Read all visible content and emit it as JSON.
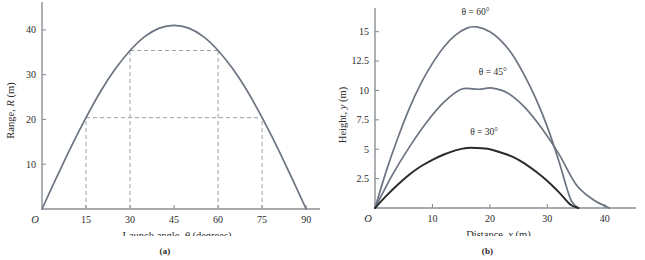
{
  "figure": {
    "panels": [
      {
        "key": "a",
        "caption": "(a)",
        "origin_label": "O"
      },
      {
        "key": "b",
        "caption": "(b)",
        "origin_label": "O"
      }
    ]
  },
  "chart_data": [
    {
      "type": "line",
      "panel": "a",
      "title": "",
      "xlabel": "Launch angle, θ (degrees)",
      "ylabel": "Range, R (m)",
      "xlabel_parts": {
        "pre": "Launch angle, ",
        "sym": "θ",
        "post": " (degrees)"
      },
      "ylabel_parts": {
        "pre": "Range, ",
        "sym": "R",
        "post": " (m)"
      },
      "xlim": [
        0,
        92
      ],
      "ylim": [
        0,
        44
      ],
      "xticks": [
        0,
        15,
        30,
        45,
        60,
        75,
        90
      ],
      "xticklabels": [
        "O",
        "15",
        "30",
        "45",
        "60",
        "75",
        "90"
      ],
      "yticks": [
        10,
        20,
        30,
        40
      ],
      "yticklabels": [
        "10",
        "20",
        "30",
        "40"
      ],
      "grid": false,
      "legend": "none",
      "series": [
        {
          "name": "Range vs launch angle",
          "color": "#6b7480",
          "x": [
            0,
            5,
            10,
            15,
            20,
            25,
            30,
            35,
            40,
            45,
            50,
            55,
            60,
            65,
            70,
            75,
            80,
            85,
            90
          ],
          "y": [
            0,
            7.1,
            14.0,
            20.4,
            26.3,
            31.3,
            35.4,
            38.5,
            40.4,
            41.0,
            40.4,
            38.5,
            35.4,
            31.3,
            26.3,
            20.4,
            14.0,
            7.1,
            0
          ]
        }
      ],
      "annotations": [
        {
          "type": "dashed-hline",
          "y": 35.4,
          "x_from": 30,
          "x_to": 60,
          "label": "equal range for 30° and 60°"
        },
        {
          "type": "dashed-hline",
          "y": 20.4,
          "x_from": 15,
          "x_to": 75,
          "label": "equal range for 15° and 75°"
        },
        {
          "type": "dashed-vline",
          "x": 15,
          "y_from": 0,
          "y_to": 20.4
        },
        {
          "type": "dashed-vline",
          "x": 30,
          "y_from": 0,
          "y_to": 35.4
        },
        {
          "type": "dashed-vline",
          "x": 60,
          "y_from": 0,
          "y_to": 35.4
        },
        {
          "type": "dashed-vline",
          "x": 75,
          "y_from": 0,
          "y_to": 20.4
        }
      ]
    },
    {
      "type": "line",
      "panel": "b",
      "title": "",
      "xlabel": "Distance, x (m)",
      "ylabel": "Height, y (m)",
      "xlabel_parts": {
        "pre": "Distance, ",
        "sym": "x",
        "post": " (m)"
      },
      "ylabel_parts": {
        "pre": "Height, ",
        "sym": "y",
        "post": " (m)"
      },
      "xlim": [
        0,
        43
      ],
      "ylim": [
        0,
        16.5
      ],
      "xticks": [
        0,
        10,
        20,
        30,
        40
      ],
      "xticklabels": [
        "O",
        "10",
        "20",
        "30",
        "40"
      ],
      "yticks": [
        2.5,
        5,
        7.5,
        10,
        12.5,
        15
      ],
      "yticklabels": [
        "2.5",
        "5",
        "7.5",
        "10",
        "12.5",
        "15"
      ],
      "grid": false,
      "legend": "inline-labels",
      "series": [
        {
          "name": "θ = 60°",
          "label": "θ = 60°",
          "color": "#6b7480",
          "label_x": 17.5,
          "label_y": 16.4,
          "x": [
            0,
            2,
            4,
            6,
            8,
            10,
            12,
            14,
            16,
            17.7,
            20,
            22,
            24,
            26,
            28,
            30,
            32,
            34,
            35.4
          ],
          "y": [
            0,
            3.2,
            6.0,
            8.5,
            10.6,
            12.3,
            13.7,
            14.7,
            15.3,
            15.4,
            15.0,
            14.2,
            13.0,
            11.3,
            9.3,
            6.9,
            4.0,
            0.8,
            0
          ]
        },
        {
          "name": "θ = 45°",
          "label": "θ = 45°",
          "color": "#6b7480",
          "label_x": 20.5,
          "label_y": 11.3,
          "x": [
            0,
            3,
            6,
            9,
            12,
            15,
            18,
            20.4,
            23,
            26,
            29,
            32,
            35,
            38,
            40.8
          ],
          "y": [
            0,
            2.8,
            5.2,
            7.3,
            9.0,
            10.1,
            10.1,
            10.2,
            9.8,
            8.6,
            6.8,
            4.6,
            2.0,
            0.7,
            0
          ]
        },
        {
          "name": "θ = 30°",
          "label": "θ = 30°",
          "color": "#2b2b2b",
          "label_x": 19,
          "label_y": 6.2,
          "x": [
            0,
            2,
            4,
            6,
            8,
            10,
            12,
            14,
            16,
            17.7,
            20,
            22,
            24,
            26,
            28,
            30,
            32,
            34,
            35.4
          ],
          "y": [
            0,
            1.05,
            2.0,
            2.85,
            3.55,
            4.1,
            4.55,
            4.9,
            5.1,
            5.1,
            5.0,
            4.7,
            4.35,
            3.8,
            3.1,
            2.3,
            1.35,
            0.3,
            0
          ]
        }
      ],
      "annotations": []
    }
  ]
}
